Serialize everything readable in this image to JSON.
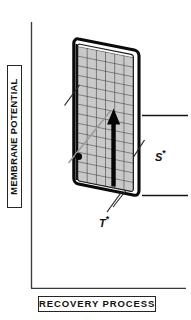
{
  "figure": {
    "kind": "scientific-schematic",
    "title_text": "",
    "background_color": "#ffffff",
    "line_color": "#1a1a1a",
    "surface_fill": "#c9c9c9",
    "grid_line_color": "#2b2b2b",
    "accent_color": "#000000"
  },
  "axes": {
    "y_label": "MEMBRANE POTENTIAL",
    "x_label": "RECOVERY  PROCESS",
    "y_axis_name": "vertical-axis-line",
    "x_axis_name": "horizontal-axis-line"
  },
  "annotations": {
    "s_label": "S",
    "s_star": "*",
    "t_label": "T",
    "t_star": "*"
  },
  "markers": {
    "trajectory_dot": "filled-circle",
    "main_arrow": "upward-arrow"
  },
  "levels": {
    "upper_line": "upper-reference-level",
    "lower_line": "lower-reference-level"
  }
}
